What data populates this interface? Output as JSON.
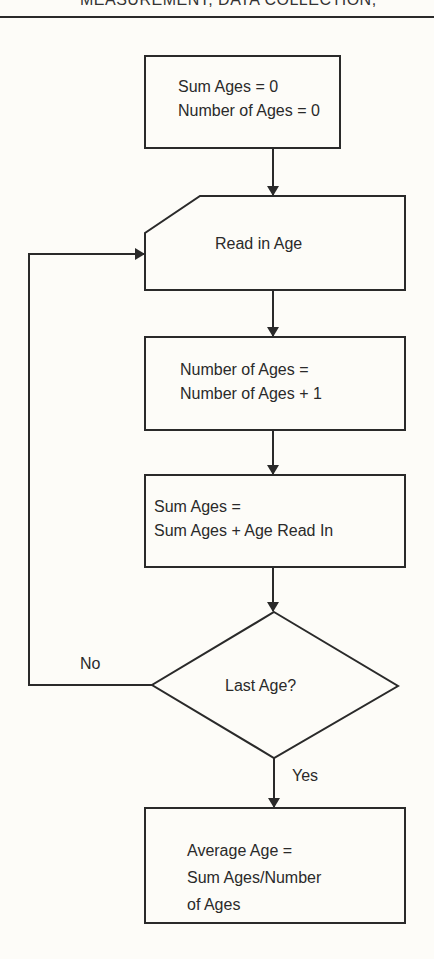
{
  "header": {
    "running_title": "MEASUREMENT, DATA COLLECTION,"
  },
  "flowchart": {
    "nodes": [
      {
        "id": "init",
        "shape": "process",
        "lines": [
          "Sum Ages = 0",
          "Number of Ages = 0"
        ]
      },
      {
        "id": "read",
        "shape": "manual-input",
        "lines": [
          "Read in Age"
        ]
      },
      {
        "id": "count",
        "shape": "process",
        "lines": [
          "Number of Ages =",
          "Number of Ages + 1"
        ]
      },
      {
        "id": "sum",
        "shape": "process",
        "lines": [
          "Sum Ages =",
          "Sum Ages + Age Read In"
        ]
      },
      {
        "id": "decision",
        "shape": "decision",
        "lines": [
          "Last Age?"
        ]
      },
      {
        "id": "average",
        "shape": "process",
        "lines": [
          "Average Age =",
          "Sum Ages/Number",
          "of Ages"
        ]
      }
    ],
    "edges": [
      {
        "from": "init",
        "to": "read",
        "label": ""
      },
      {
        "from": "read",
        "to": "count",
        "label": ""
      },
      {
        "from": "count",
        "to": "sum",
        "label": ""
      },
      {
        "from": "sum",
        "to": "decision",
        "label": ""
      },
      {
        "from": "decision",
        "to": "read",
        "label": "No"
      },
      {
        "from": "decision",
        "to": "average",
        "label": "Yes"
      }
    ]
  },
  "colors": {
    "line": "#2a2a2a",
    "background": "#fdfcf8"
  }
}
